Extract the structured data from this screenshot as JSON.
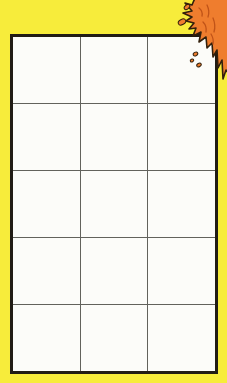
{
  "page": {
    "text_content": ""
  },
  "grid": {
    "columns": 3,
    "rows": 5,
    "cell_count": 15,
    "cells_empty": true
  },
  "decorations": {
    "splat": "orange-paint-splat",
    "droplet_count": 5
  },
  "colors": {
    "background": "#f7ec3b",
    "grid_cell": "#fcfcf9",
    "grid_line": "#62625c",
    "grid_border": "#211c15",
    "splat_fill": "#ef7d2e",
    "splat_detail": "#c05318",
    "splat_outline": "#33200c"
  }
}
